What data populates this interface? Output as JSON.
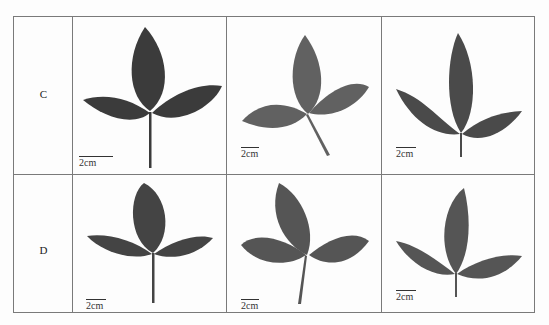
{
  "figure": {
    "rows": [
      {
        "label": "C",
        "cells": [
          {
            "scale_label": "2cm",
            "leaf_color": "#3b3b3b"
          },
          {
            "scale_label": "2cm",
            "leaf_color": "#616161"
          },
          {
            "scale_label": "2cm",
            "leaf_color": "#4a4a4a"
          }
        ]
      },
      {
        "label": "D",
        "cells": [
          {
            "scale_label": "2cm",
            "leaf_color": "#444444"
          },
          {
            "scale_label": "2cm",
            "leaf_color": "#555555"
          },
          {
            "scale_label": "2cm",
            "leaf_color": "#555555"
          }
        ]
      }
    ]
  }
}
